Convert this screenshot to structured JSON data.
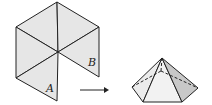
{
  "diagram": {
    "net_labels": {
      "a": "A",
      "b": "B"
    },
    "colors": {
      "face": "#e6e6e6",
      "face_dark": "#c8c8c8",
      "line": "#222222",
      "bg": "#ffffff"
    }
  }
}
